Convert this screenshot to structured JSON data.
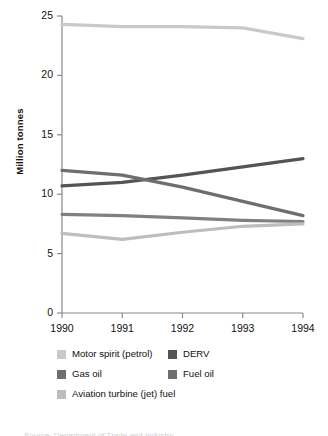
{
  "chart_data": {
    "type": "line",
    "title": "",
    "subtitle": "",
    "xlabel": "",
    "ylabel": "Million tonnes",
    "x": [
      1990,
      1991,
      1992,
      1993,
      1994
    ],
    "x_tick_labels": [
      "1990",
      "1991",
      "1992",
      "1993",
      "1994"
    ],
    "y_tick_labels": [
      "0",
      "5",
      "10",
      "15",
      "20",
      "25"
    ],
    "y_ticks": [
      0,
      5,
      10,
      15,
      20,
      25
    ],
    "ylim": [
      0,
      25
    ],
    "xlim": [
      1990,
      1994
    ],
    "grid": false,
    "legend_position": "below",
    "series": [
      {
        "name": "Motor spirit (petrol)",
        "color": "#c9c9c9",
        "values": [
          24.3,
          24.1,
          24.1,
          24.0,
          23.1
        ]
      },
      {
        "name": "DERV",
        "color": "#545454",
        "values": [
          10.7,
          11.0,
          11.6,
          12.3,
          13.0
        ]
      },
      {
        "name": "Gas oil",
        "color": "#6e6e6e",
        "values": [
          12.0,
          11.6,
          10.6,
          9.4,
          8.2
        ]
      },
      {
        "name": "Fuel oil",
        "color": "#808080",
        "values": [
          8.3,
          8.2,
          8.0,
          7.8,
          7.7
        ]
      },
      {
        "name": "Aviation turbine (jet) fuel",
        "color": "#bdbdbd",
        "values": [
          6.7,
          6.2,
          6.8,
          7.3,
          7.5
        ]
      }
    ]
  },
  "axes": {
    "y_title": "Million tonnes",
    "y_labels": [
      "25",
      "20",
      "15",
      "10",
      "5",
      "0"
    ],
    "x_labels": [
      "1990",
      "1991",
      "1992",
      "1993",
      "1994"
    ],
    "axis_color": "#8a8a8a"
  },
  "legend": {
    "items": [
      {
        "label": "Motor spirit (petrol)",
        "color": "#c9c9c9"
      },
      {
        "label": "DERV",
        "color": "#545454"
      },
      {
        "label": "Gas oil",
        "color": "#6e6e6e"
      },
      {
        "label": "Fuel oil",
        "color": "#6e6e6e"
      },
      {
        "label": "Aviation turbine (jet) fuel",
        "color": "#bdbdbd"
      }
    ]
  },
  "source_note": {
    "text": "Source: Department of Trade and Industry"
  }
}
